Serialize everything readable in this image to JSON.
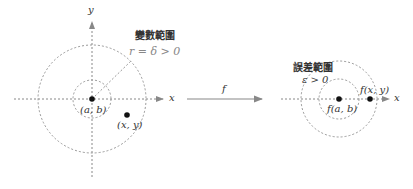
{
  "diagram": {
    "left_panel": {
      "title": "變數範圍",
      "radius_label": "r = δ > 0",
      "axis_x_label": "x",
      "axis_y_label": "y",
      "center_point_label": "(a, b)",
      "other_point_label": "(x, y)"
    },
    "mapping": {
      "arrow_label": "f"
    },
    "right_panel": {
      "title": "誤差範圍",
      "epsilon_label": "ε > 0",
      "axis_x_label": "x",
      "center_point_label": "f(a, b)",
      "other_point_label": "f(x, y)"
    },
    "colors": {
      "line": "#888888",
      "dot": "#111111",
      "text": "#333333"
    }
  }
}
